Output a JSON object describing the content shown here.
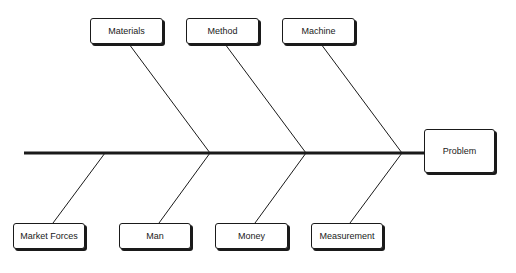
{
  "diagram": {
    "type": "fishbone",
    "head": {
      "label": "Problem"
    },
    "top_causes": [
      {
        "label": "Materials"
      },
      {
        "label": "Method"
      },
      {
        "label": "Machine"
      }
    ],
    "bottom_causes": [
      {
        "label": "Market Forces"
      },
      {
        "label": "Man"
      },
      {
        "label": "Money"
      },
      {
        "label": "Measurement"
      }
    ],
    "colors": {
      "line": "#1a1a1a",
      "box_fill": "#ffffff",
      "background": "#ffffff"
    }
  }
}
